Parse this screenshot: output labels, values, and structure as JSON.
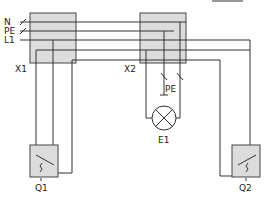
{
  "diagram": {
    "type": "wiring-schematic",
    "title_bar": "",
    "supply_labels": [
      "N",
      "PE",
      "L1"
    ],
    "junction_boxes": [
      {
        "id": "X1",
        "label": "X1"
      },
      {
        "id": "X2",
        "label": "X2"
      }
    ],
    "switches": [
      {
        "id": "Q1",
        "label": "Q1",
        "kind": "two-way switch"
      },
      {
        "id": "Q2",
        "label": "Q2",
        "kind": "two-way switch"
      }
    ],
    "load": {
      "id": "E1",
      "label": "E1",
      "kind": "lamp"
    },
    "pe_label": "PE",
    "colors": {
      "line": "#333333",
      "box_fill": "#dcdcdc",
      "box_stroke": "#444444",
      "background": "#ffffff"
    }
  }
}
